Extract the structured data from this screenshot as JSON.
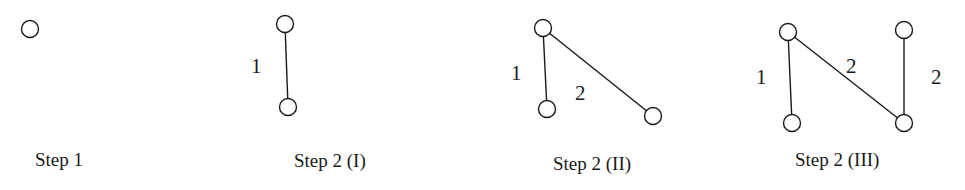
{
  "diagram": {
    "node_color": "#ffffff",
    "stroke_color": "#1a1a1a",
    "steps": [
      {
        "caption": "Step 1",
        "nodes": [
          {
            "id": "a",
            "x": 30,
            "y": 29
          }
        ],
        "edges": []
      },
      {
        "caption": "Step 2 (I)",
        "nodes": [
          {
            "id": "a",
            "x": 285,
            "y": 24
          },
          {
            "id": "b",
            "x": 288,
            "y": 107
          }
        ],
        "edges": [
          {
            "from": "a",
            "to": "b",
            "weight": "1"
          }
        ]
      },
      {
        "caption": "Step 2 (II)",
        "nodes": [
          {
            "id": "a",
            "x": 543,
            "y": 28
          },
          {
            "id": "b",
            "x": 547,
            "y": 109
          },
          {
            "id": "c",
            "x": 653,
            "y": 116
          }
        ],
        "edges": [
          {
            "from": "a",
            "to": "b",
            "weight": "1"
          },
          {
            "from": "a",
            "to": "c",
            "weight": "2"
          }
        ]
      },
      {
        "caption": "Step 2 (III)",
        "nodes": [
          {
            "id": "a",
            "x": 788,
            "y": 32
          },
          {
            "id": "b",
            "x": 792,
            "y": 123
          },
          {
            "id": "c",
            "x": 904,
            "y": 123
          },
          {
            "id": "d",
            "x": 904,
            "y": 30
          }
        ],
        "edges": [
          {
            "from": "a",
            "to": "b",
            "weight": "1"
          },
          {
            "from": "a",
            "to": "c",
            "weight": "2"
          },
          {
            "from": "d",
            "to": "c",
            "weight": "2"
          }
        ]
      }
    ]
  }
}
